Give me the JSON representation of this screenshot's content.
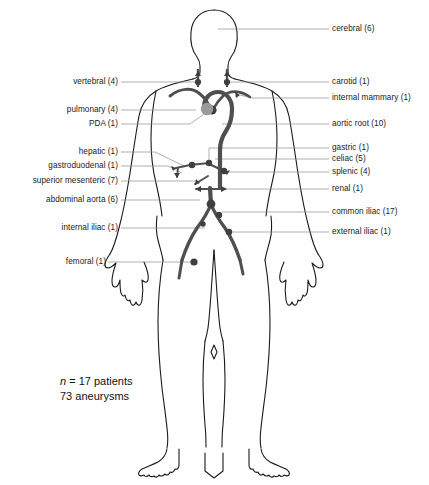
{
  "figure": {
    "body_outline_color": "#1a1a1a",
    "vessel_color": "#4f4f4f",
    "leader_line_color": "#8c8c8c",
    "pulmonary_marker_color": "#9a9a9a",
    "background_color": "#ffffff"
  },
  "caption": {
    "n_symbol": "n",
    "n_text": " = 17 patients",
    "line2": "73 aneurysms"
  },
  "labels_left": [
    {
      "name": "vertebral",
      "text": "vertebral (4)",
      "count": 4,
      "x_right": 118,
      "y": 82,
      "leader_to_x": 197,
      "leader_to_y": 82
    },
    {
      "name": "pulmonary",
      "text": "pulmonary (4)",
      "count": 4,
      "x_right": 118,
      "y": 110,
      "leader_to_x": 196,
      "leader_to_y": 110
    },
    {
      "name": "pda",
      "text": "PDA (1)",
      "count": 1,
      "x_right": 118,
      "y": 124,
      "leader_to_x": 206,
      "leader_to_y": 110
    },
    {
      "name": "hepatic",
      "text": "hepatic (1)",
      "count": 1,
      "x_right": 118,
      "y": 152,
      "leader_to_x": 183,
      "leader_to_y": 164
    },
    {
      "name": "gastroduodenal",
      "text": "gastroduodenal (1)",
      "count": 1,
      "x_right": 118,
      "y": 166,
      "leader_to_x": 180,
      "leader_to_y": 172
    },
    {
      "name": "superior-mesenteric",
      "text": "superior mesenteric (7)",
      "count": 7,
      "x_right": 118,
      "y": 181,
      "leader_to_x": 197,
      "leader_to_y": 181
    },
    {
      "name": "abdominal-aorta",
      "text": "abdominal aorta (6)",
      "count": 6,
      "x_right": 118,
      "y": 200,
      "leader_to_x": 200,
      "leader_to_y": 200
    },
    {
      "name": "internal-iliac",
      "text": "internal iliac (1)",
      "count": 1,
      "x_right": 118,
      "y": 228,
      "leader_to_x": 205,
      "leader_to_y": 228
    },
    {
      "name": "femoral",
      "text": "femoral (1)",
      "count": 1,
      "x_right": 106,
      "y": 262,
      "leader_to_x": 194,
      "leader_to_y": 262
    }
  ],
  "labels_right": [
    {
      "name": "cerebral",
      "text": "cerebral (6)",
      "count": 6,
      "x_left": 332,
      "y": 29,
      "leader_to_x": 218,
      "leader_to_y": 29
    },
    {
      "name": "carotid",
      "text": "carotid (1)",
      "count": 1,
      "x_left": 332,
      "y": 82,
      "leader_to_x": 227,
      "leader_to_y": 82
    },
    {
      "name": "internal-mammary",
      "text": "internal mammary (1)",
      "count": 1,
      "x_left": 332,
      "y": 98,
      "leader_to_x": 245,
      "leader_to_y": 98
    },
    {
      "name": "aortic-root",
      "text": "aortic root (10)",
      "count": 10,
      "x_left": 332,
      "y": 124,
      "leader_to_x": 222,
      "leader_to_y": 124
    },
    {
      "name": "gastric",
      "text": "gastric (1)",
      "count": 1,
      "x_left": 332,
      "y": 148,
      "leader_to_x": 212,
      "leader_to_y": 148
    },
    {
      "name": "celiac",
      "text": "celiac (5)",
      "count": 5,
      "x_left": 332,
      "y": 159,
      "leader_to_x": 215,
      "leader_to_y": 159
    },
    {
      "name": "splenic",
      "text": "splenic (4)",
      "count": 4,
      "x_left": 332,
      "y": 172,
      "leader_to_x": 219,
      "leader_to_y": 172
    },
    {
      "name": "renal",
      "text": "renal (1)",
      "count": 1,
      "x_left": 332,
      "y": 189,
      "leader_to_x": 213,
      "leader_to_y": 189
    },
    {
      "name": "common-iliac",
      "text": "common iliac (17)",
      "count": 17,
      "x_left": 332,
      "y": 212,
      "leader_to_x": 215,
      "leader_to_y": 212
    },
    {
      "name": "external-iliac",
      "text": "external iliac (1)",
      "count": 1,
      "x_left": 332,
      "y": 232,
      "leader_to_x": 222,
      "leader_to_y": 232
    }
  ],
  "chart_data": {
    "type": "diagram",
    "categories": [
      "cerebral",
      "vertebral",
      "carotid",
      "internal mammary",
      "pulmonary",
      "PDA",
      "aortic root",
      "gastric",
      "hepatic",
      "celiac",
      "splenic",
      "gastroduodenal",
      "superior mesenteric",
      "renal",
      "abdominal aorta",
      "common iliac",
      "internal iliac",
      "external iliac",
      "femoral"
    ],
    "values": [
      6,
      4,
      1,
      1,
      4,
      1,
      10,
      1,
      1,
      5,
      4,
      1,
      7,
      1,
      6,
      17,
      1,
      1,
      1
    ],
    "total_aneurysms": 73,
    "total_patients": 17,
    "xlabel": "vessel",
    "ylabel": "number of aneurysms"
  }
}
